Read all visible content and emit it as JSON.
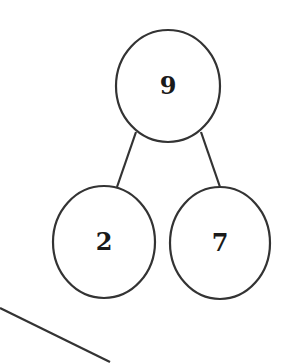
{
  "diagram": {
    "type": "number-bond",
    "colors": {
      "stroke": "#333333",
      "text": "#1a1a1a",
      "background": "#ffffff"
    },
    "whole": {
      "value": "9",
      "cx": 168,
      "cy": 86,
      "rx": 52,
      "ry": 56
    },
    "parts": [
      {
        "value": "2",
        "cx": 104,
        "cy": 242,
        "rx": 51,
        "ry": 56
      },
      {
        "value": "7",
        "cx": 220,
        "cy": 243,
        "rx": 50,
        "ry": 56
      }
    ],
    "connectors": [
      {
        "x1": 136,
        "y1": 132,
        "x2": 117,
        "y2": 187
      },
      {
        "x1": 201,
        "y1": 132,
        "x2": 220,
        "y2": 187
      }
    ],
    "stray_line": {
      "x1": 0,
      "y1": 308,
      "x2": 110,
      "y2": 362
    }
  }
}
